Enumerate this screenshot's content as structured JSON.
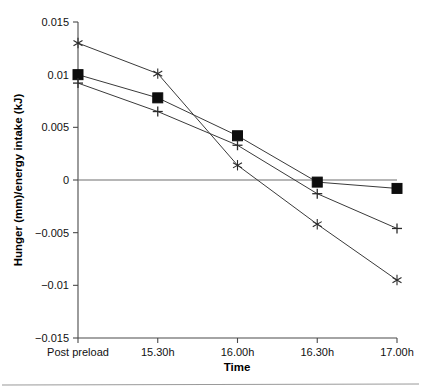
{
  "chart_data": {
    "type": "line",
    "title": "",
    "xlabel": "Time",
    "ylabel": "Hunger (mm)/energy intake (kJ)",
    "categories": [
      "Post preload",
      "15.30h",
      "16.00h",
      "16.30h",
      "17.00h"
    ],
    "ylim": [
      -0.015,
      0.015
    ],
    "yticks": [
      0.015,
      0.01,
      0.005,
      0,
      -0.005,
      -0.01,
      -0.015
    ],
    "ytick_labels": [
      "0.015",
      "0.01",
      "0.005",
      "0",
      "−0.005",
      "−0.01",
      "−0.015"
    ],
    "grid": false,
    "zero_line": true,
    "legend": "none",
    "series": [
      {
        "name": "series-square",
        "marker": "filled-square",
        "values": [
          0.01,
          0.0078,
          0.0042,
          -0.0002,
          -0.0008
        ]
      },
      {
        "name": "series-plus",
        "marker": "plus",
        "values": [
          0.0092,
          0.0065,
          0.0033,
          -0.0013,
          -0.0046
        ]
      },
      {
        "name": "series-star",
        "marker": "asterisk",
        "values": [
          0.013,
          0.0101,
          0.0014,
          -0.0042,
          -0.0095
        ]
      }
    ]
  },
  "figure": {
    "x_axis_title": "Time",
    "y_axis_title": "Hunger (mm)/energy intake (kJ)",
    "x_tick_labels": [
      "Post preload",
      "15.30h",
      "16.00h",
      "16.30h",
      "17.00h"
    ],
    "y_tick_labels": [
      "0.015",
      "0.01",
      "0.005",
      "0",
      "−0.005",
      "−0.01",
      "−0.015"
    ]
  },
  "colors": {
    "axis": "#4a4a4a",
    "zero_line": "#6f6f6f",
    "series_line": "#3a3a3a",
    "marker": "#0d0d0d",
    "background": "#ffffff",
    "page_rule": "#9a9a9a"
  }
}
